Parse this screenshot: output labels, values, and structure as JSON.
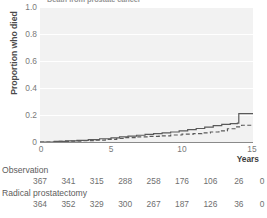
{
  "chart_data": {
    "type": "line",
    "title": "Death from prostate cancer",
    "xlabel": "Years",
    "ylabel": "Proportion who died",
    "xlim": [
      0,
      15
    ],
    "ylim": [
      0,
      1.0
    ],
    "xticks": [
      0,
      5,
      10,
      15
    ],
    "xtick_labels": [
      "0",
      "5",
      "10",
      "15"
    ],
    "yticks": [
      0,
      0.2,
      0.4,
      0.6,
      0.8,
      1.0
    ],
    "ytick_labels": [
      "0",
      "0.2",
      "0.4",
      "0.6",
      "0.8",
      "1.0"
    ],
    "grid": "horizontal",
    "legend": "none",
    "series": [
      {
        "name": "Observation",
        "style": "solid",
        "color": "#5a5a5a",
        "points": [
          [
            0,
            0.0
          ],
          [
            1.0,
            0.005
          ],
          [
            1.8,
            0.008
          ],
          [
            2.6,
            0.012
          ],
          [
            3.4,
            0.018
          ],
          [
            4.2,
            0.024
          ],
          [
            5.0,
            0.03
          ],
          [
            5.6,
            0.038
          ],
          [
            6.2,
            0.044
          ],
          [
            6.8,
            0.05
          ],
          [
            7.4,
            0.056
          ],
          [
            8.0,
            0.062
          ],
          [
            8.6,
            0.068
          ],
          [
            9.2,
            0.074
          ],
          [
            9.8,
            0.082
          ],
          [
            10.4,
            0.092
          ],
          [
            11.0,
            0.1
          ],
          [
            11.6,
            0.11
          ],
          [
            12.2,
            0.122
          ],
          [
            12.8,
            0.13
          ],
          [
            13.4,
            0.136
          ],
          [
            13.9,
            0.14
          ],
          [
            14.0,
            0.21
          ],
          [
            15.0,
            0.21
          ]
        ]
      },
      {
        "name": "Radical prostatectomy",
        "style": "dashed",
        "color": "#5a5a5a",
        "points": [
          [
            0,
            0.0
          ],
          [
            1.2,
            0.004
          ],
          [
            2.2,
            0.007
          ],
          [
            3.0,
            0.01
          ],
          [
            3.8,
            0.014
          ],
          [
            4.6,
            0.02
          ],
          [
            5.4,
            0.026
          ],
          [
            6.0,
            0.032
          ],
          [
            6.8,
            0.038
          ],
          [
            7.6,
            0.042
          ],
          [
            8.4,
            0.046
          ],
          [
            9.2,
            0.052
          ],
          [
            10.0,
            0.058
          ],
          [
            10.8,
            0.062
          ],
          [
            11.4,
            0.068
          ],
          [
            12.0,
            0.074
          ],
          [
            12.6,
            0.082
          ],
          [
            13.2,
            0.098
          ],
          [
            13.8,
            0.112
          ],
          [
            14.2,
            0.124
          ],
          [
            15.0,
            0.124
          ]
        ]
      }
    ]
  },
  "risk_table": {
    "tick_years": [
      0,
      2,
      4,
      6,
      8,
      10,
      12,
      14,
      15
    ],
    "rows": [
      {
        "label": "Observation",
        "values": [
          "367",
          "341",
          "315",
          "288",
          "258",
          "176",
          "106",
          "26",
          "0"
        ]
      },
      {
        "label": "Radical prostatectomy",
        "values": [
          "364",
          "352",
          "329",
          "300",
          "267",
          "187",
          "126",
          "36",
          "0"
        ]
      }
    ]
  },
  "colors": {
    "plot_background": "#f2f2f2",
    "gridline": "#ffffff",
    "axis": "#8a8a8a",
    "line": "#5a5a5a",
    "text": "#6f6f6f"
  }
}
